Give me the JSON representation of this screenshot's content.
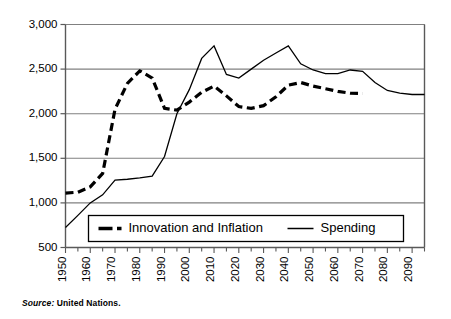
{
  "figure": {
    "source_keyword": "Source:",
    "source_value": " United Nations."
  },
  "legend": {
    "items": [
      {
        "label": "Innovation and Inflation",
        "style": "dashed"
      },
      {
        "label": "Spending",
        "style": "solid"
      }
    ]
  },
  "axes": {
    "y_ticks": [
      "500",
      "1,000",
      "1,500",
      "2,000",
      "2,500",
      "3,000"
    ],
    "x_ticks": [
      "1950",
      "1960",
      "1970",
      "1980",
      "1990",
      "2000",
      "2010",
      "2020",
      "2030",
      "2040",
      "2050",
      "2060",
      "2070",
      "2080",
      "2090"
    ]
  },
  "colors": {
    "line": "#000000",
    "grid": "#808080",
    "axis": "#595959",
    "background": "#ffffff"
  },
  "chart_data": {
    "type": "line",
    "title": "",
    "subtitle": "",
    "xlabel": "",
    "ylabel": "",
    "xlim": [
      1950,
      2095
    ],
    "ylim": [
      500,
      3000
    ],
    "grid": true,
    "legend_position": "inside-bottom",
    "x_tick_interval": 10,
    "minor_tick_interval": 5,
    "y_tick_values": [
      500,
      1000,
      1500,
      2000,
      2500,
      3000
    ],
    "x_tick_values": [
      1950,
      1960,
      1970,
      1980,
      1990,
      2000,
      2010,
      2020,
      2030,
      2040,
      2050,
      2060,
      2070,
      2080,
      2090
    ],
    "series": [
      {
        "name": "Innovation and Inflation",
        "style": "dashed",
        "x": [
          1950,
          1955,
          1960,
          1965,
          1970,
          1975,
          1980,
          1985,
          1990,
          1995,
          2000,
          2005,
          2010,
          2015,
          2020,
          2025,
          2030,
          2035,
          2040,
          2045,
          2050,
          2055,
          2060,
          2065,
          2070
        ],
        "values": [
          1110,
          1120,
          1180,
          1330,
          2050,
          2340,
          2480,
          2400,
          2060,
          2040,
          2130,
          2240,
          2310,
          2200,
          2080,
          2060,
          2090,
          2190,
          2320,
          2350,
          2310,
          2280,
          2250,
          2230,
          2225
        ]
      },
      {
        "name": "Spending",
        "style": "solid",
        "x": [
          1950,
          1955,
          1960,
          1965,
          1970,
          1975,
          1980,
          1985,
          1990,
          1995,
          2000,
          2005,
          2010,
          2015,
          2020,
          2025,
          2030,
          2035,
          2040,
          2045,
          2050,
          2055,
          2060,
          2065,
          2070,
          2075,
          2080,
          2085,
          2090,
          2095
        ],
        "values": [
          725,
          860,
          1000,
          1090,
          1255,
          1265,
          1280,
          1300,
          1520,
          2000,
          2270,
          2620,
          2760,
          2440,
          2400,
          2500,
          2600,
          2680,
          2760,
          2560,
          2490,
          2450,
          2450,
          2490,
          2475,
          2350,
          2260,
          2230,
          2215,
          2215
        ]
      }
    ]
  }
}
